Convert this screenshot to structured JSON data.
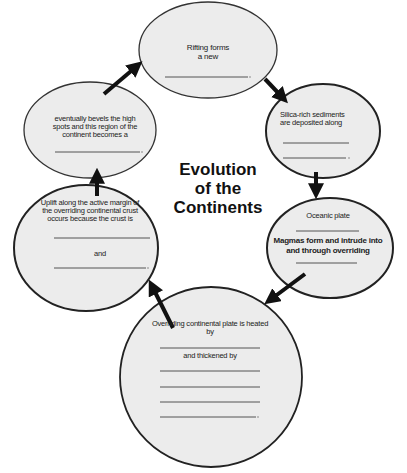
{
  "title": {
    "line1": "Evolution",
    "line2": "of the",
    "line3": "Continents"
  },
  "colors": {
    "ellipse_fill": "#ececec",
    "ellipse_stroke": "#333333",
    "arrow": "#111111",
    "blank_line": "#444444"
  },
  "nodes": [
    {
      "id": "rifting",
      "text_lines": [
        "Rifting forms",
        "a new"
      ],
      "blank_count": 1
    },
    {
      "id": "silica",
      "text_lines": [
        "Silica-rich sediments",
        "are deposited along"
      ],
      "blank_count": 2
    },
    {
      "id": "oceanic",
      "text_lines": [
        "Oceanic plate"
      ],
      "text2_lines": [
        "Magmas form and intrude into",
        "and through overriding"
      ],
      "blank_count": 2
    },
    {
      "id": "heated",
      "text_lines": [
        "Overriding continental plate is heated",
        "by"
      ],
      "text2": "and thickened by",
      "blank_count": 5
    },
    {
      "id": "uplift",
      "text_lines": [
        "Uplift along the active margin of",
        "the overriding continental crust",
        "occurs because the crust is"
      ],
      "text2": "and",
      "blank_count": 2
    },
    {
      "id": "bevels",
      "text_lines": [
        "eventually bevels the high",
        "spots and this region of the",
        "continent becomes a"
      ],
      "blank_count": 1
    }
  ]
}
